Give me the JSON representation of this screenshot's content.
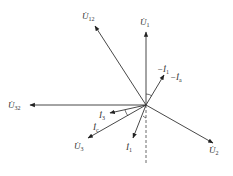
{
  "origin": [
    146,
    105
  ],
  "vectors": [
    {
      "name": "U1",
      "label": "U̇",
      "sub": "1",
      "to": [
        146,
        32
      ],
      "lx": 140,
      "ly": 25
    },
    {
      "name": "U12",
      "label": "U̇",
      "sub": "12",
      "to": [
        95,
        26
      ],
      "lx": 82,
      "ly": 19
    },
    {
      "name": "U32",
      "label": "U̇",
      "sub": "32",
      "to": [
        30,
        105
      ],
      "lx": 8,
      "ly": 108
    },
    {
      "name": "U3",
      "label": "U̇",
      "sub": "3",
      "to": [
        88,
        138
      ],
      "lx": 74,
      "ly": 149
    },
    {
      "name": "U2",
      "label": "U̇",
      "sub": "2",
      "to": [
        213,
        143
      ],
      "lx": 209,
      "ly": 153
    },
    {
      "name": "minus-I1-Ia",
      "label": "−İ",
      "sub": "1",
      "to": [
        164,
        75
      ],
      "lx": 157,
      "ly": 72
    },
    {
      "name": "I3",
      "label": "İ",
      "sub": "3",
      "to": [
        110,
        113
      ],
      "lx": 99,
      "ly": 118
    },
    {
      "name": "I1",
      "label": "İ",
      "sub": "1",
      "to": [
        133,
        138
      ],
      "lx": 126,
      "ly": 150
    }
  ],
  "extra_labels": [
    {
      "name": "Ia",
      "label": "−İ",
      "sub": "a",
      "x": 170,
      "y": 80
    },
    {
      "name": "Ic",
      "label": "İ",
      "sub": "c",
      "x": 93,
      "y": 130
    }
  ],
  "dashed_line": {
    "from": [
      146,
      105
    ],
    "to": [
      146,
      165
    ]
  }
}
